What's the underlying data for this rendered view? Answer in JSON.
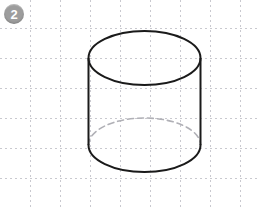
{
  "canvas": {
    "width": 257,
    "height": 208,
    "background_color": "#ffffff"
  },
  "badge": {
    "label": "2",
    "shape": "circle",
    "fill_color": "#9d9d9d",
    "text_color": "#ffffff",
    "cx": 14,
    "cy": 14,
    "r": 10
  },
  "grid": {
    "visible": true,
    "style": "dashed",
    "color": "#c9c9cf",
    "spacing": 30,
    "dash": "2,3",
    "stroke_width": 1,
    "vertical_lines": [
      30,
      60,
      90,
      120,
      150,
      180,
      210,
      240
    ],
    "horizontal_lines": [
      28,
      58,
      88,
      118,
      148,
      178
    ]
  },
  "figure": {
    "name": "cylinder",
    "stroke_color": "#1a1a1a",
    "stroke_width": 2,
    "hidden_edge_color": "#b0b0b6",
    "hidden_edge_width": 1.6,
    "hidden_edge_dash": "6,4",
    "fill": "none",
    "center_x": 144.5,
    "radius_x": 56,
    "radius_y": 27,
    "top_center_y": 58,
    "bottom_center_y": 145,
    "height": 87,
    "top_ellipse_solid": true,
    "bottom_front_arc_solid": true,
    "bottom_back_arc_hidden": true
  }
}
